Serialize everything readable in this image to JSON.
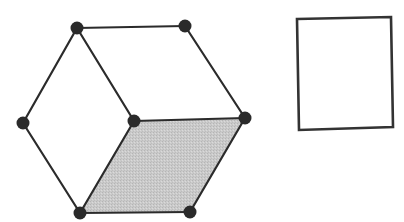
{
  "diagram": {
    "nodes": [
      {
        "id": "top-left",
        "x": 77,
        "y": 28
      },
      {
        "id": "top-right",
        "x": 185,
        "y": 26
      },
      {
        "id": "left",
        "x": 23,
        "y": 123
      },
      {
        "id": "center",
        "x": 134,
        "y": 121
      },
      {
        "id": "right",
        "x": 245,
        "y": 118
      },
      {
        "id": "bottom-left",
        "x": 80,
        "y": 213
      },
      {
        "id": "bottom-right",
        "x": 190,
        "y": 212
      }
    ],
    "edges": [
      [
        "top-left",
        "top-right"
      ],
      [
        "top-right",
        "right"
      ],
      [
        "top-left",
        "left"
      ],
      [
        "top-left",
        "center"
      ],
      [
        "left",
        "bottom-left"
      ],
      [
        "center",
        "right"
      ],
      [
        "center",
        "bottom-left"
      ],
      [
        "right",
        "bottom-right"
      ],
      [
        "bottom-left",
        "bottom-right"
      ]
    ],
    "shaded_face": {
      "vertices": [
        "center",
        "right",
        "bottom-right",
        "bottom-left"
      ],
      "fill": "#c9c9c9"
    },
    "rectangle": {
      "corners": [
        [
          297,
          19
        ],
        [
          391,
          17
        ],
        [
          393,
          127
        ],
        [
          299,
          130
        ]
      ],
      "stroke": "#333333"
    },
    "colors": {
      "edge": "#2b2b2b",
      "node": "#2a2a2a",
      "background": "#ffffff"
    }
  }
}
